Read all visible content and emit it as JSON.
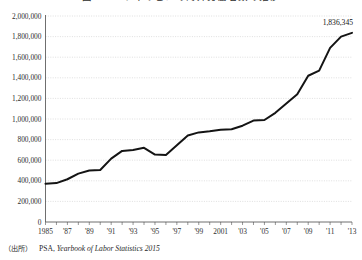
{
  "figure": {
    "title_clipped": "図2－2　フィリピンの海外労働者数の推移",
    "title_visible": false
  },
  "source": {
    "prefix": "（出所）",
    "organization": "PSA,",
    "publication": "Yearbook of Labor Statistics 2015"
  },
  "chart_data": {
    "type": "line",
    "title": "",
    "xlabel": "",
    "ylabel": "",
    "ylim": [
      0,
      2000000
    ],
    "xlim": [
      1985,
      2013
    ],
    "grid": true,
    "legend": false,
    "legend_position": "none",
    "line_color": "#141414",
    "y_ticks": [
      0,
      200000,
      400000,
      600000,
      800000,
      1000000,
      1200000,
      1400000,
      1600000,
      1800000,
      2000000
    ],
    "y_tick_labels": [
      "0",
      "200,000",
      "400,000",
      "600,000",
      "800,000",
      "1,000,000",
      "1,200,000",
      "1,400,000",
      "1,600,000",
      "1,800,000",
      "2,000,000"
    ],
    "x_ticks": [
      1985,
      1986,
      1987,
      1988,
      1989,
      1990,
      1991,
      1992,
      1993,
      1994,
      1995,
      1996,
      1997,
      1998,
      1999,
      2000,
      2001,
      2002,
      2003,
      2004,
      2005,
      2006,
      2007,
      2008,
      2009,
      2010,
      2011,
      2012,
      2013
    ],
    "x_tick_labels": [
      {
        "x": 1985,
        "label": "1985"
      },
      {
        "x": 1987,
        "label": "'87"
      },
      {
        "x": 1989,
        "label": "'89"
      },
      {
        "x": 1991,
        "label": "'91"
      },
      {
        "x": 1993,
        "label": "'93"
      },
      {
        "x": 1995,
        "label": "'95"
      },
      {
        "x": 1997,
        "label": "'97"
      },
      {
        "x": 1999,
        "label": "'99"
      },
      {
        "x": 2001,
        "label": "2001"
      },
      {
        "x": 2003,
        "label": "'03"
      },
      {
        "x": 2005,
        "label": "'05"
      },
      {
        "x": 2007,
        "label": "'07"
      },
      {
        "x": 2009,
        "label": "'09"
      },
      {
        "x": 2011,
        "label": "'11"
      },
      {
        "x": 2013,
        "label": "'13"
      }
    ],
    "x": [
      1985,
      1986,
      1987,
      1988,
      1989,
      1990,
      1991,
      1992,
      1993,
      1994,
      1995,
      1996,
      1997,
      1998,
      1999,
      2000,
      2001,
      2002,
      2003,
      2004,
      2005,
      2006,
      2007,
      2008,
      2009,
      2010,
      2011,
      2012,
      2013
    ],
    "values": [
      372000,
      378000,
      415000,
      470000,
      500000,
      505000,
      615000,
      690000,
      700000,
      720000,
      655000,
      650000,
      745000,
      840000,
      870000,
      880000,
      895000,
      900000,
      935000,
      985000,
      990000,
      1060000,
      1150000,
      1240000,
      1420000,
      1470000,
      1690000,
      1800000,
      1836345
    ],
    "annotations": [
      {
        "x": 2013,
        "y": 1836345,
        "label": "1,836,345"
      }
    ]
  }
}
